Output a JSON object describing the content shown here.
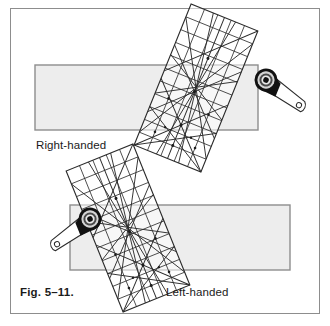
{
  "figure": {
    "caption": "Fig. 5–11.",
    "labels": {
      "right_handed": "Right-handed",
      "left_handed": "Left-handed"
    },
    "colors": {
      "frame_border": "#8d8d8d",
      "fabric_fill": "#ededed",
      "fabric_border": "#8d8d8d",
      "ruler_line": "#2b2b2b",
      "ruler_fill": "#ffffff",
      "cutter_body": "#111111",
      "cutter_ring_mid": "#7a7a7a",
      "cutter_ring_light": "#d4d4d4",
      "handle_fill": "#ffffff",
      "handle_stroke": "#2b2b2b",
      "text": "#1b1b1b"
    },
    "scenes": [
      {
        "name": "right-handed",
        "label": "Right-handed",
        "fabric_strip": {
          "x": 35,
          "y": 65,
          "width": 223,
          "height": 65
        },
        "ruler": {
          "center_x": 196,
          "center_y": 88,
          "width": 72,
          "height": 152,
          "rotation_deg": 22
        },
        "cutter": {
          "center_x": 266,
          "center_y": 80,
          "radius": 11,
          "handle_angle_deg": 22,
          "handle_length": 42
        },
        "icons": [
          "quilting-ruler-icon",
          "rotary-cutter-icon",
          "fabric-strip-icon"
        ]
      },
      {
        "name": "left-handed",
        "label": "Left-handed",
        "fabric_strip": {
          "x": 70,
          "y": 205,
          "width": 220,
          "height": 65
        },
        "ruler": {
          "center_x": 128,
          "center_y": 228,
          "width": 72,
          "height": 152,
          "rotation_deg": -22
        },
        "cutter": {
          "center_x": 90,
          "center_y": 219,
          "radius": 11,
          "handle_angle_deg": 158,
          "handle_length": 42
        },
        "icons": [
          "quilting-ruler-icon",
          "rotary-cutter-icon",
          "fabric-strip-icon"
        ]
      }
    ],
    "ruler_grid": {
      "columns": 5,
      "rows": 11,
      "diagonal_guides_deg": [
        30,
        45,
        60,
        120,
        135,
        150
      ],
      "description": "transparent rectangular quilting ruler with square grid and angled guide lines"
    }
  }
}
